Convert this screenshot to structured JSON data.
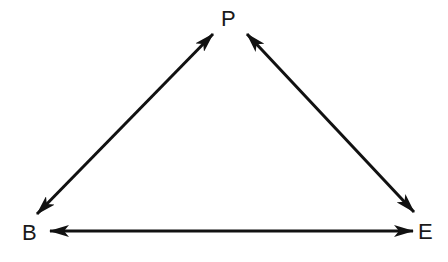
{
  "diagram": {
    "type": "triangle-relationship",
    "nodes": [
      {
        "id": "P",
        "label": "P",
        "position": "top"
      },
      {
        "id": "B",
        "label": "B",
        "position": "bottom-left"
      },
      {
        "id": "E",
        "label": "E",
        "position": "bottom-right"
      }
    ],
    "edges": [
      {
        "from": "B",
        "to": "P",
        "direction": "bidirectional"
      },
      {
        "from": "P",
        "to": "E",
        "direction": "bidirectional"
      },
      {
        "from": "B",
        "to": "E",
        "direction": "bidirectional"
      }
    ],
    "colors": {
      "stroke": "#111111",
      "background": "#ffffff"
    }
  }
}
